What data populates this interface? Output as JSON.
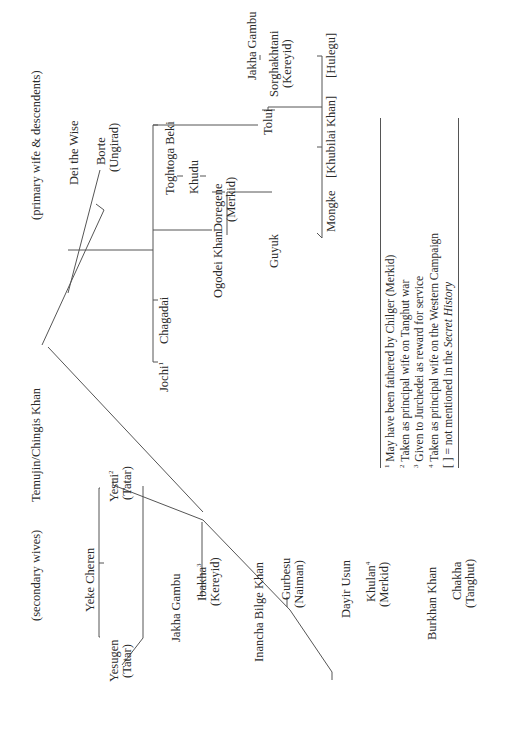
{
  "diagram": {
    "root": {
      "name": "Temujin/Chingis Khan"
    },
    "section_labels": {
      "primary": "(primary wife & descendents)",
      "secondary": "(secondary wives)"
    },
    "primary": {
      "wife_father": "Dei the Wise",
      "wife": "Borte",
      "wife_tribe": "(Ungirad)",
      "sons": [
        {
          "name": "Jochi",
          "note": "1"
        },
        {
          "name": "Chagadai"
        },
        {
          "name": "Ogodei Khan"
        },
        {
          "name": "Tolui"
        }
      ],
      "ogodei_branch": {
        "wife_grandfather": "Toghtoga Beki",
        "wife_father": "Khudu",
        "wife": "Doregene",
        "wife_tribe": "(Merkid)",
        "son": "Guyuk"
      },
      "tolui_branch": {
        "wife_father": "Jakha Gambu",
        "wife": "Sorghakhtani",
        "wife_tribe": "(Kereyid)",
        "sons": [
          "Mongke",
          "[Khubilai Khan]",
          "[Hulegu]"
        ]
      }
    },
    "secondary": {
      "wives": [
        {
          "father": "Yeke Cheren",
          "name": "Yesui",
          "note": "2",
          "tribe": "(Tatar)"
        },
        {
          "father": "Yeke Cheren",
          "name": "Yesugen",
          "tribe": "(Tatar)"
        },
        {
          "father": "Jakha Gambu",
          "name": "Ibakha",
          "note": "3",
          "tribe": "(Kereyid)"
        },
        {
          "father": "Inancha Bilge Khan",
          "name": "Gurbesu",
          "tribe": "(Naiman)"
        },
        {
          "father": "Dayir Usun",
          "name": "Khulan",
          "note": "4",
          "tribe": "(Merkid)"
        },
        {
          "father": "Burkhan Khan",
          "name": "Chakha",
          "tribe": "(Tanghut)"
        }
      ]
    },
    "legend": {
      "items": [
        {
          "mark": "1",
          "text": "May have been fathered by Chilger (Merkid)"
        },
        {
          "mark": "2",
          "text": "Taken as principal wife on Tanghut war"
        },
        {
          "mark": "3",
          "text": "Given to Jurchedei as reward for service"
        },
        {
          "mark": "4",
          "text": "Taken as principal wife on the Western Campaign"
        }
      ],
      "bracket_mark": "[ ]",
      "bracket_text": "= not mentioned in the",
      "bracket_italic": "Secret History"
    }
  }
}
